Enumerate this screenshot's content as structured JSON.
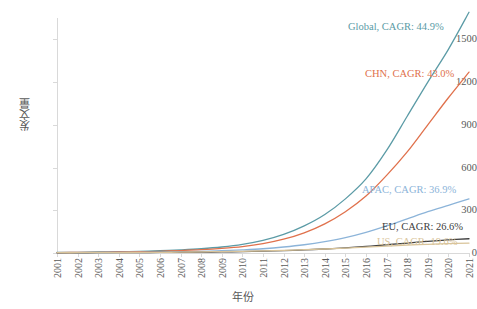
{
  "chart_data": {
    "type": "line",
    "title": "",
    "xlabel": "年份",
    "ylabel": "发文量",
    "x": [
      2001,
      2002,
      2003,
      2004,
      2005,
      2006,
      2007,
      2008,
      2009,
      2010,
      2011,
      2012,
      2013,
      2014,
      2015,
      2016,
      2017,
      2018,
      2019,
      2020,
      2021
    ],
    "categories": [
      "2001",
      "2002",
      "2003",
      "2004",
      "2005",
      "2006",
      "2007",
      "2008",
      "2009",
      "2010",
      "2011",
      "2012",
      "2013",
      "2014",
      "2015",
      "2016",
      "2017",
      "2018",
      "2019",
      "2020",
      "2021"
    ],
    "xlim": [
      2001,
      2021
    ],
    "ylim": [
      0,
      1650
    ],
    "yticks": [
      0,
      300,
      600,
      900,
      1200,
      1500
    ],
    "ytick_labels": [
      "0",
      "300",
      "600",
      "900",
      "1200",
      "1500"
    ],
    "grid": false,
    "legend": "inline-end-labels",
    "series": [
      {
        "name": "Global",
        "label": "Global, CAGR: 44.9%",
        "cagr": "44.9%",
        "color": "#5B9BA6",
        "values": [
          4,
          5,
          7,
          9,
          12,
          16,
          22,
          30,
          42,
          60,
          88,
          130,
          190,
          270,
          380,
          520,
          720,
          960,
          1200,
          1430,
          1690
        ]
      },
      {
        "name": "CHN",
        "label": "CHN, CAGR: 43.0%",
        "cagr": "43.0%",
        "color": "#E0714C",
        "values": [
          3,
          4,
          5,
          7,
          9,
          12,
          17,
          23,
          32,
          45,
          66,
          97,
          142,
          205,
          290,
          400,
          545,
          710,
          900,
          1090,
          1270
        ]
      },
      {
        "name": "APAC",
        "label": "APAC, CAGR: 36.9%",
        "cagr": "36.9%",
        "color": "#8CB4D9",
        "values": [
          2,
          3,
          3,
          4,
          5,
          7,
          9,
          12,
          16,
          22,
          30,
          42,
          58,
          80,
          108,
          145,
          190,
          240,
          290,
          335,
          380
        ]
      },
      {
        "name": "EU",
        "label": "EU, CAGR: 26.6%",
        "cagr": "26.6%",
        "color": "#404040",
        "values": [
          1,
          1,
          2,
          2,
          3,
          4,
          5,
          6,
          8,
          10,
          13,
          17,
          22,
          28,
          36,
          46,
          58,
          70,
          82,
          92,
          100
        ]
      },
      {
        "name": "US",
        "label": "US, CAGR: 19.6%",
        "cagr": "19.6%",
        "color": "#D9C49A",
        "values": [
          2,
          2,
          3,
          3,
          4,
          5,
          6,
          8,
          10,
          12,
          15,
          19,
          23,
          28,
          34,
          41,
          48,
          55,
          61,
          66,
          70
        ]
      }
    ]
  }
}
